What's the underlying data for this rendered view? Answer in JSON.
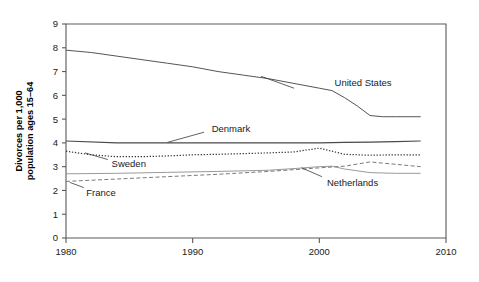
{
  "chart_data": {
    "type": "line",
    "title": "",
    "xlabel": "",
    "ylabel_line1": "Divorces per 1,000",
    "ylabel_line2": "population ages 15–64",
    "xlim": [
      1980,
      2010
    ],
    "ylim": [
      0,
      9
    ],
    "xticks": [
      1980,
      1990,
      2000,
      2010
    ],
    "xtick_labels": [
      "1980",
      "1990",
      "2000",
      "2010"
    ],
    "yticks": [
      0,
      1,
      2,
      3,
      4,
      5,
      6,
      7,
      8,
      9
    ],
    "ytick_labels": [
      "0",
      "1",
      "2",
      "3",
      "4",
      "5",
      "6",
      "7",
      "8",
      "9"
    ],
    "grid": false,
    "legend_position": "inline-annotations",
    "series": [
      {
        "name": "United States",
        "style": "solid",
        "color": "#555555",
        "width": 1.0,
        "label_x": 2001.2,
        "label_y": 6.55,
        "leader_from_x": 1998.0,
        "leader_from_y": 6.3,
        "leader_to_x": 1995.4,
        "leader_to_y": 6.8,
        "x": [
          1980,
          1982,
          1984,
          1986,
          1988,
          1990,
          1992,
          1994,
          1996,
          1998,
          2000,
          2001,
          2002,
          2003,
          2004,
          2005,
          2006,
          2007,
          2008
        ],
        "values": [
          7.9,
          7.8,
          7.65,
          7.5,
          7.35,
          7.2,
          7.0,
          6.85,
          6.7,
          6.5,
          6.3,
          6.2,
          5.9,
          5.55,
          5.15,
          5.1,
          5.1,
          5.1,
          5.1
        ]
      },
      {
        "name": "Denmark",
        "style": "solid",
        "color": "#4a4a4a",
        "width": 1.2,
        "label_x": 1991.5,
        "label_y": 4.62,
        "leader_from_x": 1990.9,
        "leader_from_y": 4.45,
        "leader_to_x": 1988.0,
        "leader_to_y": 4.02,
        "x": [
          1980,
          1984,
          1988,
          1992,
          1996,
          2000,
          2002,
          2004,
          2006,
          2008
        ],
        "values": [
          4.08,
          4.0,
          4.0,
          4.0,
          4.0,
          4.0,
          4.02,
          4.03,
          4.05,
          4.08
        ]
      },
      {
        "name": "Sweden",
        "style": "dotted",
        "color": "#333333",
        "width": 1.2,
        "label_x": 1983.6,
        "label_y": 3.12,
        "leader_from_x": 1983.3,
        "leader_from_y": 3.3,
        "leader_to_x": 1981.5,
        "leader_to_y": 3.58,
        "x": [
          1980,
          1982,
          1984,
          1986,
          1988,
          1990,
          1992,
          1994,
          1996,
          1998,
          2000,
          2002,
          2004,
          2006,
          2008
        ],
        "values": [
          3.65,
          3.5,
          3.42,
          3.42,
          3.45,
          3.5,
          3.52,
          3.55,
          3.58,
          3.62,
          3.78,
          3.52,
          3.48,
          3.5,
          3.5
        ]
      },
      {
        "name": "Netherlands",
        "style": "solid",
        "color": "#9a9a9a",
        "width": 1.0,
        "label_x": 2000.6,
        "label_y": 2.35,
        "leader_from_x": 2000.2,
        "leader_from_y": 2.58,
        "leader_to_x": 1998.6,
        "leader_to_y": 2.95,
        "x": [
          1980,
          1984,
          1988,
          1992,
          1996,
          1998,
          2000,
          2001,
          2002,
          2004,
          2006,
          2008
        ],
        "values": [
          2.7,
          2.72,
          2.76,
          2.8,
          2.85,
          2.92,
          3.0,
          3.02,
          2.9,
          2.75,
          2.72,
          2.72
        ]
      },
      {
        "name": "France",
        "style": "dashed",
        "color": "#7a7a7a",
        "width": 1.0,
        "label_x": 1981.6,
        "label_y": 1.93,
        "leader_from_x": 1981.4,
        "leader_from_y": 2.12,
        "leader_to_x": 1980.3,
        "leader_to_y": 2.34,
        "x": [
          1980,
          1984,
          1988,
          1992,
          1996,
          2000,
          2002,
          2004,
          2006,
          2008
        ],
        "values": [
          2.38,
          2.48,
          2.58,
          2.68,
          2.8,
          2.95,
          3.02,
          3.2,
          3.1,
          3.0
        ]
      }
    ]
  }
}
